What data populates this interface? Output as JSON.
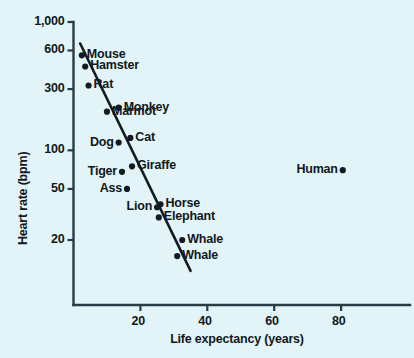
{
  "chart_data": {
    "type": "scatter",
    "title": "",
    "xlabel": "Life expectancy (years)",
    "ylabel": "Heart rate (bpm)",
    "xlim": [
      0,
      102
    ],
    "ylim": [
      12,
      1000
    ],
    "yscale": "log",
    "xscale": "linear",
    "grid": false,
    "legend": "none",
    "xticks": [
      20,
      40,
      60,
      80
    ],
    "xtick_labels": [
      "20",
      "40",
      "60",
      "80"
    ],
    "yticks": [
      1000,
      600,
      300,
      100,
      50,
      20
    ],
    "ytick_labels": [
      "1,000",
      "600",
      "300",
      "100",
      "50",
      "20"
    ],
    "points": [
      {
        "label": "Mouse",
        "x": 2.5,
        "y": 550,
        "label_side": "right"
      },
      {
        "label": "Hamster",
        "x": 3.5,
        "y": 450,
        "label_side": "right"
      },
      {
        "label": "Rat",
        "x": 4.5,
        "y": 320,
        "label_side": "right"
      },
      {
        "label": "Monkey",
        "x": 13.5,
        "y": 215,
        "label_side": "right"
      },
      {
        "label": "Marmot",
        "x": 10.0,
        "y": 200,
        "label_side": "right"
      },
      {
        "label": "Cat",
        "x": 17.0,
        "y": 125,
        "label_side": "right"
      },
      {
        "label": "Dog",
        "x": 13.5,
        "y": 115,
        "label_side": "left"
      },
      {
        "label": "Giraffe",
        "x": 17.5,
        "y": 75,
        "label_side": "right"
      },
      {
        "label": "Tiger",
        "x": 14.5,
        "y": 68,
        "label_side": "left"
      },
      {
        "label": "Ass",
        "x": 16.0,
        "y": 50,
        "label_side": "left"
      },
      {
        "label": "Horse",
        "x": 26.0,
        "y": 38,
        "label_side": "right"
      },
      {
        "label": "Lion",
        "x": 25.0,
        "y": 36,
        "label_side": "left"
      },
      {
        "label": "Elephant",
        "x": 25.5,
        "y": 30,
        "label_side": "right"
      },
      {
        "label": "Whale",
        "x": 32.5,
        "y": 20,
        "label_side": "right"
      },
      {
        "label": "Whale",
        "x": 31.0,
        "y": 15,
        "label_side": "right"
      },
      {
        "label": "Human",
        "x": 80.5,
        "y": 70,
        "label_side": "left"
      }
    ],
    "trendline": {
      "x0": 2.0,
      "y0": 680,
      "x1": 35.0,
      "y1": 11.5
    },
    "colors": {
      "background": "#e2f4f7",
      "axis": "#2b3b45",
      "marker": "#141b22",
      "text": "#111820",
      "trendline": "#141b22"
    }
  }
}
